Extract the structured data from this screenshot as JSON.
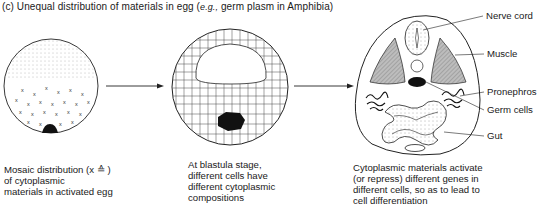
{
  "figure": {
    "title_prefix": "(c) Unequal distribution of materials in egg (",
    "title_eg": "e.g.,",
    "title_suffix": " germ plasm in Amphibia)",
    "panels": [
      {
        "id": "egg",
        "caption": "Mosaic distribution (x ≙ )\nof cytoplasmic\nmaterials in activated egg"
      },
      {
        "id": "blastula",
        "caption": "At blastula stage,\ndifferent cells have\ndifferent cytoplasmic\ncompositions"
      },
      {
        "id": "embryo-section",
        "caption": "Cytoplasmic materials activate\n(or repress) different genes in\ndifferent cells, so as to lead to\ncell differentiation",
        "labels": [
          "Nerve cord",
          "Muscle",
          "Pronephros",
          "Germ cells",
          "Gut"
        ]
      }
    ],
    "colors": {
      "ink": "#1a1a1a",
      "shade": "#9a9a9a",
      "background": "#ffffff"
    }
  }
}
